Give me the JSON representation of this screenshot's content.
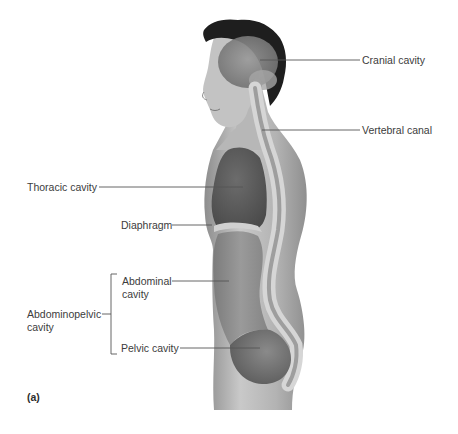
{
  "figure": {
    "panel": "(a)",
    "colors": {
      "background": "#ffffff",
      "skin": "#b9b9b9",
      "cavity_dark": "#5e5e5e",
      "cavity_mid": "#8a8a8a",
      "spine": "#d2d2d2",
      "hair": "#1c1c1c",
      "leader_line": "#555555",
      "text": "#3c3c3c"
    },
    "labels": {
      "cranial": "Cranial cavity",
      "vertebral": "Vertebral canal",
      "thoracic": "Thoracic cavity",
      "diaphragm": "Diaphragm",
      "abdominal_line1": "Abdominal",
      "abdominal_line2": "cavity",
      "abdominopelvic_line1": "Abdominopelvic",
      "abdominopelvic_line2": "cavity",
      "pelvic": "Pelvic cavity"
    }
  }
}
